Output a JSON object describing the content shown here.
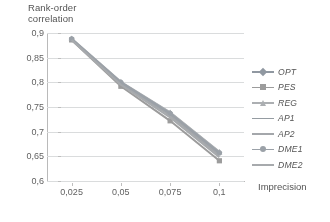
{
  "chart_data": {
    "type": "line",
    "title": "",
    "xlabel": "Imprecision",
    "ylabel": "Rank-order\ncorrelation",
    "x": [
      0.025,
      0.05,
      0.075,
      0.1
    ],
    "xtick_labels": [
      "0,025",
      "0,05",
      "0,075",
      "0,1"
    ],
    "ytick_labels": [
      "0,9",
      "0,85",
      "0,8",
      "0,75",
      "0,7",
      "0,65",
      "0,6"
    ],
    "ytick_values": [
      0.9,
      0.85,
      0.8,
      0.75,
      0.7,
      0.65,
      0.6
    ],
    "xlim": [
      0.0125,
      0.1125
    ],
    "ylim": [
      0.6,
      0.9
    ],
    "grid": "horizontal",
    "legend_position": "right",
    "series": [
      {
        "name": "OPT",
        "marker": "diamond",
        "color": "#8796a8",
        "values": [
          0.888,
          0.8,
          0.738,
          0.658
        ]
      },
      {
        "name": "PES",
        "marker": "square",
        "color": "#9a9a9a",
        "values": [
          0.886,
          0.792,
          0.722,
          0.641
        ]
      },
      {
        "name": "REG",
        "marker": "triangle",
        "color": "#a8aeb4",
        "values": [
          0.889,
          0.801,
          0.739,
          0.659
        ]
      },
      {
        "name": "AP1",
        "marker": "none",
        "color": "#8d9aa6",
        "values": [
          0.887,
          0.799,
          0.736,
          0.655
        ]
      },
      {
        "name": "AP2",
        "marker": "none",
        "color": "#9fa6ad",
        "values": [
          0.887,
          0.797,
          0.733,
          0.652
        ]
      },
      {
        "name": "DME1",
        "marker": "circle",
        "color": "#93a0ac",
        "values": [
          0.888,
          0.8,
          0.737,
          0.657
        ]
      },
      {
        "name": "DME2",
        "marker": "none",
        "color": "#a3a9af",
        "values": [
          0.886,
          0.795,
          0.729,
          0.648
        ]
      }
    ]
  },
  "axes": {
    "y_title": "Rank-order\ncorrelation",
    "x_title": "Imprecision"
  },
  "legend": {
    "items": [
      {
        "label": "OPT"
      },
      {
        "label": "PES"
      },
      {
        "label": "REG"
      },
      {
        "label": "AP1"
      },
      {
        "label": "AP2"
      },
      {
        "label": "DME1"
      },
      {
        "label": "DME2"
      }
    ]
  },
  "colors": {
    "gridline": "#d9dde0",
    "axis": "#b9b9b9",
    "text": "#4d4d4d",
    "background": "#ffffff"
  }
}
